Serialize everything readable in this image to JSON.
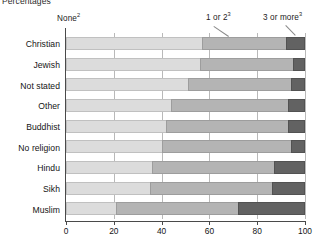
{
  "chart": {
    "axis_unit_label": "Percentages",
    "legend": [
      {
        "id": "none",
        "label": "None",
        "note": "2",
        "color": "#dcdcdc"
      },
      {
        "id": "one_or_two",
        "label": "1 or 2",
        "note": "3",
        "color": "#b4b4b4"
      },
      {
        "id": "three_or_more",
        "label": "3 or more",
        "note": "3",
        "color": "#626262"
      }
    ],
    "x_ticks": [
      "0",
      "20",
      "40",
      "60",
      "80",
      "100"
    ]
  },
  "chart_data": {
    "type": "bar",
    "orientation": "horizontal",
    "stacked": true,
    "normalized_percent": true,
    "title": "",
    "subtitle": "",
    "xlabel": "Percentages",
    "ylabel": "",
    "xlim": [
      0,
      100
    ],
    "xticks": [
      0,
      20,
      40,
      60,
      80,
      100
    ],
    "grid": "vertical",
    "legend_position": "top",
    "categories": [
      "Christian",
      "Jewish",
      "Not stated",
      "Other",
      "Buddhist",
      "No religion",
      "Hindu",
      "Sikh",
      "Muslim"
    ],
    "series": [
      {
        "name": "None",
        "note": "2",
        "color": "#dcdcdc",
        "values": [
          57,
          56,
          51,
          44,
          42,
          40,
          36,
          35,
          21
        ]
      },
      {
        "name": "1 or 2",
        "note": "3",
        "color": "#b4b4b4",
        "values": [
          35,
          39,
          43,
          49,
          51,
          54,
          51,
          51,
          51
        ]
      },
      {
        "name": "3 or more",
        "note": "3",
        "color": "#626262",
        "values": [
          8,
          5,
          6,
          7,
          7,
          6,
          13,
          14,
          28
        ]
      }
    ]
  }
}
